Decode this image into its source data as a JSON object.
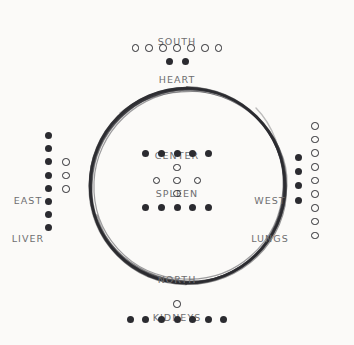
{
  "diagram": {
    "background_color": "#fbfaf8",
    "ink_color": "#2b2b30",
    "label_color": "#6e6e70",
    "ring": {
      "name": "hand-drawn-circle",
      "center_x": 187,
      "center_y": 185,
      "radius": 97,
      "style": "multi-stroke sketch"
    },
    "quadrants": {
      "south": {
        "direction": "SOUTH",
        "organ": "HEART",
        "rows": [
          {
            "style": "hollow",
            "count": 7
          },
          {
            "style": "filled",
            "count": 2
          }
        ]
      },
      "north": {
        "direction": "NORTH",
        "organ": "KIDNEYS",
        "rows": [
          {
            "style": "hollow",
            "count": 1
          },
          {
            "style": "filled",
            "count": 7
          }
        ]
      },
      "east": {
        "direction": "EAST",
        "organ": "LIVER",
        "columns": [
          {
            "style": "filled",
            "count": 8
          },
          {
            "style": "hollow",
            "count": 3
          }
        ]
      },
      "west": {
        "direction": "WEST",
        "organ": "LUNGS",
        "columns": [
          {
            "style": "filled",
            "count": 4
          },
          {
            "style": "hollow",
            "count": 9
          }
        ]
      },
      "center": {
        "direction": "CENTER",
        "organ": "SPLEEN",
        "rows": [
          {
            "style": "filled",
            "count": 5
          },
          {
            "style": "hollow",
            "count": 1
          },
          {
            "style": "hollow",
            "count": 3
          },
          {
            "style": "hollow",
            "count": 1
          },
          {
            "style": "filled",
            "count": 5
          }
        ]
      }
    }
  }
}
